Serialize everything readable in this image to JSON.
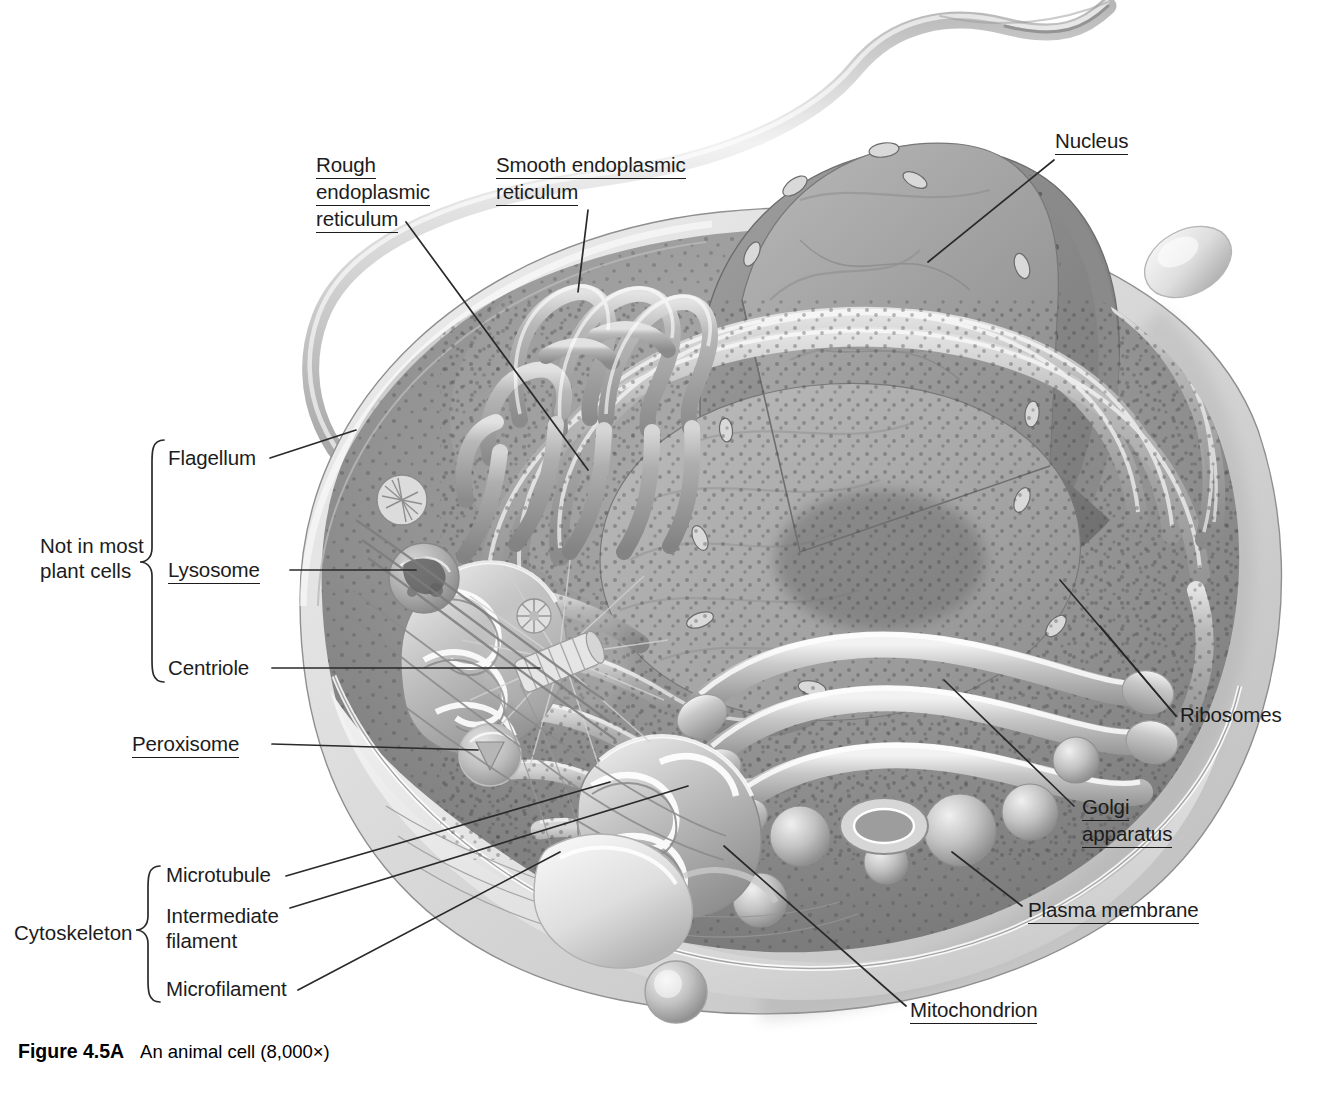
{
  "figure": {
    "caption_number": "Figure 4.5A",
    "caption_text": "An animal cell (8,000×)",
    "magnification": "8,000×"
  },
  "labels": {
    "rough_er": "Rough\nendoplasmic\nreticulum",
    "rough_er_line1": "Rough",
    "rough_er_line2": "endoplasmic",
    "rough_er_line3": "reticulum",
    "smooth_er_line1": "Smooth endoplasmic",
    "smooth_er_line2": "reticulum",
    "nucleus": "Nucleus",
    "ribosomes": "Ribosomes",
    "golgi_line1": "Golgi",
    "golgi_line2": "apparatus",
    "plasma_membrane": "Plasma membrane",
    "mitochondrion": "Mitochondrion",
    "flagellum": "Flagellum",
    "lysosome": "Lysosome",
    "centriole": "Centriole",
    "peroxisome": "Peroxisome",
    "microtubule": "Microtubule",
    "intermediate_filament_line1": "Intermediate",
    "intermediate_filament_line2": "filament",
    "microfilament": "Microfilament"
  },
  "groups": {
    "not_in_plant_line1": "Not in most",
    "not_in_plant_line2": "plant cells",
    "cytoskeleton": "Cytoskeleton"
  },
  "underlined_terms": [
    "Rough endoplasmic reticulum",
    "Smooth endoplasmic reticulum",
    "Nucleus",
    "Golgi apparatus",
    "Plasma membrane",
    "Mitochondrion",
    "Lysosome",
    "Peroxisome"
  ],
  "plain_terms": [
    "Ribosomes",
    "Flagellum",
    "Centriole",
    "Microtubule",
    "Intermediate filament",
    "Microfilament",
    "Not in most plant cells",
    "Cytoskeleton"
  ],
  "colors": {
    "background": "#ffffff",
    "ink": "#1c1c1c",
    "leader_line": "#2a2a2a",
    "cytoplasm_mid": "#9a9a9a",
    "cytoplasm_dark": "#6f6f6f",
    "membrane_light": "#d8d8d8",
    "nucleus_fill": "#8e8e8e",
    "nucleus_shadow": "#6a6a6a",
    "organelle_highlight": "#e9e9e9"
  }
}
